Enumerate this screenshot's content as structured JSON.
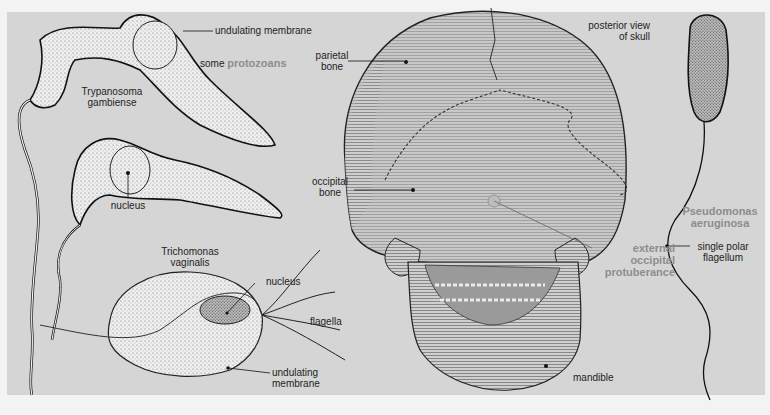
{
  "figure": {
    "background_color": "#d5d5d5",
    "label_color": "#1e1e1e",
    "highlight_color": "#8d8d8d"
  },
  "protozoans": {
    "group_prefix": "some",
    "group_name": "protozoans",
    "trypanosoma": {
      "name_line1": "Trypanosoma",
      "name_line2": "gambiense",
      "label_membrane": "undulating membrane",
      "label_nucleus": "nucleus"
    },
    "trichomonas": {
      "name_line1": "Trichomonas",
      "name_line2": "vaginalis",
      "label_nucleus": "nucleus",
      "label_flagella": "flagella",
      "label_membrane_line1": "undulating",
      "label_membrane_line2": "membrane"
    }
  },
  "skull": {
    "view_line1": "posterior view",
    "view_line2": "of skull",
    "label_parietal_line1": "parietal",
    "label_parietal_line2": "bone",
    "label_occipital_line1": "occipital",
    "label_occipital_line2": "bone",
    "label_protuberance_line1": "external",
    "label_protuberance_line2": "occipital",
    "label_protuberance_line3": "protuberance",
    "label_mandible": "mandible"
  },
  "bacterium": {
    "name_line1": "Pseudomonas",
    "name_line2": "aeruginosa",
    "label_flagellum_line1": "single polar",
    "label_flagellum_line2": "flagellum"
  }
}
